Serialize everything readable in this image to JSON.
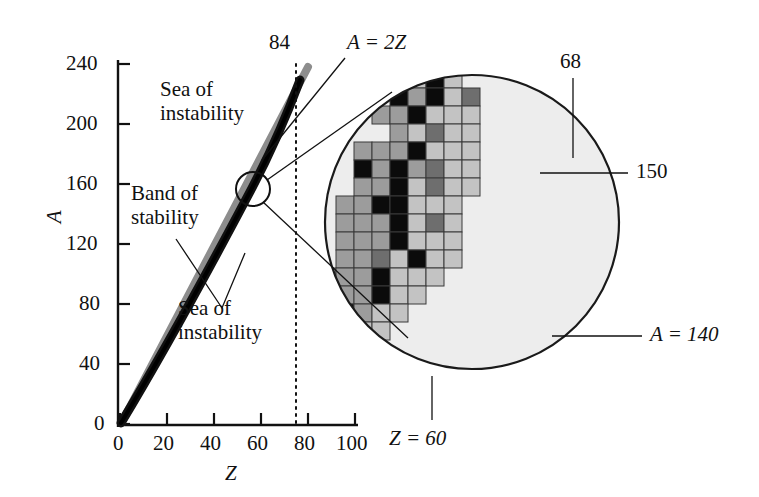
{
  "figure": {
    "type": "scatter-schematic"
  },
  "axes": {
    "x": {
      "label": "Z",
      "ticks": [
        "0",
        "20",
        "40",
        "60",
        "80",
        "100"
      ],
      "tick_values": [
        0,
        20,
        40,
        60,
        80,
        100
      ],
      "range": [
        0,
        112
      ]
    },
    "y": {
      "label": "A",
      "ticks": [
        "0",
        "40",
        "80",
        "120",
        "160",
        "200",
        "240"
      ],
      "tick_values": [
        0,
        40,
        80,
        120,
        160,
        200,
        240
      ],
      "range": [
        0,
        255
      ]
    }
  },
  "annotations": {
    "sea_top": "Sea of\ninstability",
    "band": "Band of\nstability",
    "sea_bottom": "Sea of\ninstability",
    "dotted_line": "84",
    "diagonal_line": "A = 2Z",
    "inset_z": "Z = 60",
    "inset_n": "68",
    "inset_a150": "150",
    "inset_a140": "A = 140"
  },
  "colors": {
    "black_cell": "#0b0b0b",
    "dark_gray_cell": "#6e6e6e",
    "mid_gray_cell": "#9c9c9c",
    "light_gray_cell": "#c3c3c3",
    "inset_background": "#ededed",
    "band_color": "#111111",
    "a2z_color": "#8d8d8d",
    "axis_color": "#111111"
  },
  "chart_data": {
    "type": "scatter",
    "title": "",
    "xlabel": "Z",
    "ylabel": "A",
    "xlim": [
      0,
      112
    ],
    "ylim": [
      0,
      255
    ],
    "grid": false,
    "legend": null,
    "series": [
      {
        "name": "Band of stability",
        "points": [
          [
            2,
            4
          ],
          [
            10,
            20
          ],
          [
            20,
            40
          ],
          [
            30,
            65
          ],
          [
            40,
            90
          ],
          [
            50,
            118
          ],
          [
            60,
            145
          ],
          [
            70,
            175
          ],
          [
            80,
            205
          ],
          [
            83,
            215
          ],
          [
            85,
            222
          ]
        ]
      },
      {
        "name": "A = 2Z",
        "points": [
          [
            0,
            0
          ],
          [
            20,
            40
          ],
          [
            40,
            80
          ],
          [
            60,
            120
          ],
          [
            80,
            160
          ],
          [
            90,
            180
          ],
          [
            95,
            190
          ]
        ]
      }
    ],
    "reference_lines": [
      {
        "name": "Z = 84 dotted",
        "orientation": "vertical",
        "value": 84
      }
    ]
  },
  "inset_grid": {
    "cell_px": 18,
    "origin_x": 336,
    "origin_y": 70,
    "legend_shades": [
      "light",
      "mid",
      "dark",
      "black"
    ],
    "cells": [
      {
        "c": 3,
        "r": 0,
        "s": "mid"
      },
      {
        "c": 4,
        "r": 0,
        "s": "light"
      },
      {
        "c": 5,
        "r": 0,
        "s": "black"
      },
      {
        "c": 6,
        "r": 0,
        "s": "light"
      },
      {
        "c": 3,
        "r": 1,
        "s": "black"
      },
      {
        "c": 4,
        "r": 1,
        "s": "mid"
      },
      {
        "c": 5,
        "r": 1,
        "s": "black"
      },
      {
        "c": 6,
        "r": 1,
        "s": "light"
      },
      {
        "c": 7,
        "r": 1,
        "s": "dark"
      },
      {
        "c": 2,
        "r": 2,
        "s": "mid"
      },
      {
        "c": 3,
        "r": 2,
        "s": "mid"
      },
      {
        "c": 4,
        "r": 2,
        "s": "black"
      },
      {
        "c": 5,
        "r": 2,
        "s": "light"
      },
      {
        "c": 6,
        "r": 2,
        "s": "light"
      },
      {
        "c": 7,
        "r": 2,
        "s": "light"
      },
      {
        "c": 3,
        "r": 3,
        "s": "mid"
      },
      {
        "c": 4,
        "r": 3,
        "s": "light"
      },
      {
        "c": 5,
        "r": 3,
        "s": "dark"
      },
      {
        "c": 6,
        "r": 3,
        "s": "light"
      },
      {
        "c": 7,
        "r": 3,
        "s": "light"
      },
      {
        "c": 1,
        "r": 4,
        "s": "mid"
      },
      {
        "c": 2,
        "r": 4,
        "s": "mid"
      },
      {
        "c": 3,
        "r": 4,
        "s": "mid"
      },
      {
        "c": 4,
        "r": 4,
        "s": "black"
      },
      {
        "c": 5,
        "r": 4,
        "s": "light"
      },
      {
        "c": 6,
        "r": 4,
        "s": "light"
      },
      {
        "c": 7,
        "r": 4,
        "s": "light"
      },
      {
        "c": 1,
        "r": 5,
        "s": "black"
      },
      {
        "c": 2,
        "r": 5,
        "s": "mid"
      },
      {
        "c": 3,
        "r": 5,
        "s": "black"
      },
      {
        "c": 4,
        "r": 5,
        "s": "mid"
      },
      {
        "c": 5,
        "r": 5,
        "s": "dark"
      },
      {
        "c": 6,
        "r": 5,
        "s": "light"
      },
      {
        "c": 7,
        "r": 5,
        "s": "light"
      },
      {
        "c": 1,
        "r": 6,
        "s": "mid"
      },
      {
        "c": 2,
        "r": 6,
        "s": "mid"
      },
      {
        "c": 3,
        "r": 6,
        "s": "black"
      },
      {
        "c": 4,
        "r": 6,
        "s": "light"
      },
      {
        "c": 5,
        "r": 6,
        "s": "dark"
      },
      {
        "c": 6,
        "r": 6,
        "s": "light"
      },
      {
        "c": 7,
        "r": 6,
        "s": "light"
      },
      {
        "c": 0,
        "r": 7,
        "s": "mid"
      },
      {
        "c": 1,
        "r": 7,
        "s": "mid"
      },
      {
        "c": 2,
        "r": 7,
        "s": "black"
      },
      {
        "c": 3,
        "r": 7,
        "s": "black"
      },
      {
        "c": 4,
        "r": 7,
        "s": "light"
      },
      {
        "c": 5,
        "r": 7,
        "s": "light"
      },
      {
        "c": 6,
        "r": 7,
        "s": "light"
      },
      {
        "c": 0,
        "r": 8,
        "s": "mid"
      },
      {
        "c": 1,
        "r": 8,
        "s": "mid"
      },
      {
        "c": 2,
        "r": 8,
        "s": "mid"
      },
      {
        "c": 3,
        "r": 8,
        "s": "black"
      },
      {
        "c": 4,
        "r": 8,
        "s": "light"
      },
      {
        "c": 5,
        "r": 8,
        "s": "dark"
      },
      {
        "c": 6,
        "r": 8,
        "s": "light"
      },
      {
        "c": 0,
        "r": 9,
        "s": "mid"
      },
      {
        "c": 1,
        "r": 9,
        "s": "mid"
      },
      {
        "c": 2,
        "r": 9,
        "s": "mid"
      },
      {
        "c": 3,
        "r": 9,
        "s": "black"
      },
      {
        "c": 4,
        "r": 9,
        "s": "light"
      },
      {
        "c": 5,
        "r": 9,
        "s": "light"
      },
      {
        "c": 6,
        "r": 9,
        "s": "light"
      },
      {
        "c": 0,
        "r": 10,
        "s": "mid"
      },
      {
        "c": 1,
        "r": 10,
        "s": "mid"
      },
      {
        "c": 2,
        "r": 10,
        "s": "dark"
      },
      {
        "c": 3,
        "r": 10,
        "s": "light"
      },
      {
        "c": 4,
        "r": 10,
        "s": "black"
      },
      {
        "c": 5,
        "r": 10,
        "s": "light"
      },
      {
        "c": 6,
        "r": 10,
        "s": "light"
      },
      {
        "c": -3,
        "r": 11,
        "s": "mid"
      },
      {
        "c": -2,
        "r": 11,
        "s": "mid"
      },
      {
        "c": -1,
        "r": 11,
        "s": "mid"
      },
      {
        "c": 0,
        "r": 11,
        "s": "mid"
      },
      {
        "c": 1,
        "r": 11,
        "s": "mid"
      },
      {
        "c": 2,
        "r": 11,
        "s": "black"
      },
      {
        "c": 3,
        "r": 11,
        "s": "light"
      },
      {
        "c": 4,
        "r": 11,
        "s": "light"
      },
      {
        "c": 5,
        "r": 11,
        "s": "light"
      },
      {
        "c": -3,
        "r": 12,
        "s": "mid"
      },
      {
        "c": -2,
        "r": 12,
        "s": "mid"
      },
      {
        "c": -1,
        "r": 12,
        "s": "black"
      },
      {
        "c": 0,
        "r": 12,
        "s": "mid"
      },
      {
        "c": 1,
        "r": 12,
        "s": "mid"
      },
      {
        "c": 2,
        "r": 12,
        "s": "black"
      },
      {
        "c": 3,
        "r": 12,
        "s": "light"
      },
      {
        "c": 4,
        "r": 12,
        "s": "light"
      },
      {
        "c": -3,
        "r": 13,
        "s": "mid"
      },
      {
        "c": -2,
        "r": 13,
        "s": "mid"
      },
      {
        "c": -1,
        "r": 13,
        "s": "mid"
      },
      {
        "c": 0,
        "r": 13,
        "s": "black"
      },
      {
        "c": 1,
        "r": 13,
        "s": "mid"
      },
      {
        "c": 2,
        "r": 13,
        "s": "light"
      },
      {
        "c": 3,
        "r": 13,
        "s": "light"
      },
      {
        "c": -3,
        "r": 14,
        "s": "mid"
      },
      {
        "c": -2,
        "r": 14,
        "s": "mid"
      },
      {
        "c": -1,
        "r": 14,
        "s": "black"
      },
      {
        "c": 0,
        "r": 14,
        "s": "mid"
      },
      {
        "c": 1,
        "r": 14,
        "s": "light"
      },
      {
        "c": 2,
        "r": 14,
        "s": "light"
      },
      {
        "c": -3,
        "r": 15,
        "s": "mid"
      },
      {
        "c": -2,
        "r": 15,
        "s": "black"
      },
      {
        "c": -1,
        "r": 15,
        "s": "light"
      },
      {
        "c": 0,
        "r": 15,
        "s": "light"
      },
      {
        "c": 1,
        "r": 15,
        "s": "light"
      },
      {
        "c": -2,
        "r": 16,
        "s": "black"
      },
      {
        "c": -1,
        "r": 16,
        "s": "light"
      },
      {
        "c": 0,
        "r": 16,
        "s": "light"
      }
    ]
  }
}
